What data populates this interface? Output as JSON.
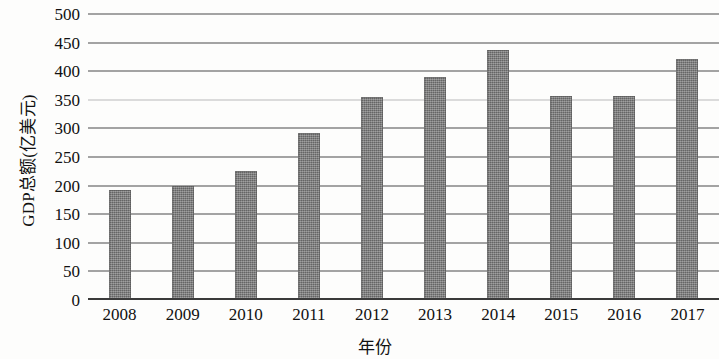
{
  "chart_data": {
    "type": "bar",
    "title": "",
    "subtitle": "",
    "xlabel": "年份",
    "ylabel": "GDP总额(亿美元)",
    "categories": [
      "2008",
      "2009",
      "2010",
      "2011",
      "2012",
      "2013",
      "2014",
      "2015",
      "2016",
      "2017"
    ],
    "values": [
      192,
      200,
      225,
      292,
      355,
      390,
      437,
      356,
      357,
      421
    ],
    "series": [
      {
        "name": "GDP总额",
        "values": [
          192,
          200,
          225,
          292,
          355,
          390,
          437,
          356,
          357,
          421
        ]
      }
    ],
    "ylim": [
      0,
      500
    ],
    "ytick_labels": [
      "0",
      "50",
      "100",
      "150",
      "200",
      "250",
      "300",
      "350",
      "400",
      "450",
      "500"
    ],
    "ytick_values": [
      0,
      50,
      100,
      150,
      200,
      250,
      300,
      350,
      400,
      450,
      500
    ],
    "ytick_step": 50,
    "grid": true,
    "grid_axis": "y",
    "legend": false,
    "legend_position": "none",
    "bar_color": "#7c7c7c",
    "gridline_color": "#4a4a4a",
    "axis_color": "#3a3a3a",
    "background_color": "#fdfdfc",
    "orientation": "vertical",
    "annotations": []
  }
}
